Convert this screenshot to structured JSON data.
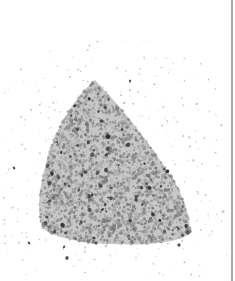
{
  "image": {
    "subject": "pile of gray sand grains on white background",
    "background_color": "#ffffff",
    "sand_colors": [
      "#8a8a8a",
      "#9a9a9a",
      "#7c7c7c",
      "#a8a8a8",
      "#b5b5b5",
      "#6f6f6f"
    ],
    "dark_grain_colors": [
      "#3a3a3a",
      "#2e2e2e",
      "#484848"
    ],
    "edge_line_color": "#a9a9a9"
  }
}
